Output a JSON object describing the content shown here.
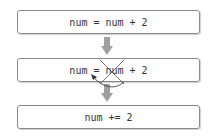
{
  "diagram": {
    "steps": [
      {
        "text": "num = num + 2"
      },
      {
        "text": "num = num + 2"
      },
      {
        "text": "num += 2"
      }
    ],
    "arrow_color": "#a0a0a0",
    "annotation": "cross-out of second 'num' with curved arrow back to '='",
    "box_border_color": "#8a8a8a"
  }
}
